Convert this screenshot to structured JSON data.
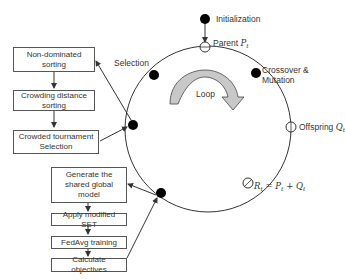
{
  "diagram": {
    "type": "NSGA-II federated learning loop",
    "cycle_nodes": [
      {
        "id": "initialization",
        "label": "Initialization",
        "style": "filled"
      },
      {
        "id": "parent",
        "label": "Parent",
        "symbol": "P",
        "subscript": "t",
        "style": "hollow"
      },
      {
        "id": "crossover",
        "label_line1": "Crossover &",
        "label_line2": "Mutation",
        "style": "filled"
      },
      {
        "id": "offspring",
        "label": "Offspring",
        "symbol": "Q",
        "subscript": "t",
        "style": "hollow"
      },
      {
        "id": "combined",
        "equation": "R_t = P_t + Q_t",
        "style": "hollow"
      },
      {
        "id": "evaluation",
        "style": "filled"
      },
      {
        "id": "selection-node",
        "style": "filled"
      },
      {
        "id": "selection",
        "label": "Selection",
        "style": "filled"
      }
    ],
    "loop_label": "Loop",
    "selection_boxes": [
      {
        "line1": "Non-dominated",
        "line2": "sorting"
      },
      {
        "line1": "Crowding distance",
        "line2": "sorting"
      },
      {
        "line1": "Crowded tournament",
        "line2": "Selection"
      }
    ],
    "evaluation_boxes": [
      {
        "line1": "Generate the",
        "line2": "shared global model"
      },
      {
        "line1": "Apply modified SET",
        "line2": ""
      },
      {
        "line1": "FedAvg training",
        "line2": ""
      },
      {
        "line1": "Calculate objectives",
        "line2": ""
      }
    ],
    "equation_parts": {
      "R": "R",
      "P": "P",
      "Q": "Q",
      "t": "t",
      "eq": " = ",
      "plus": " + "
    },
    "colors": {
      "line": "#333333",
      "node_fill": "#000000",
      "arrow_fill": "#c8c8c8",
      "box_border": "#555555"
    }
  }
}
